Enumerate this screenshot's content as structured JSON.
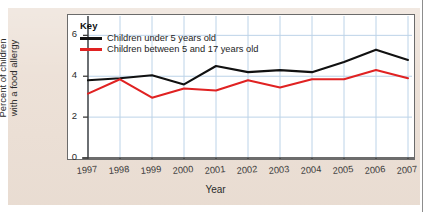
{
  "colors": {
    "page_panel": "#ece0d6",
    "plot_background": "#ffffff",
    "grid": "#bcd3e8",
    "axis": "#3b3b3b",
    "series_under5": "#111111",
    "series_5to17": "#e02222"
  },
  "legend": {
    "title": "Key",
    "position": "top-left-inside",
    "items": [
      {
        "label": "Children under 5 years old",
        "color": "#111111",
        "swatch": "line-swatch"
      },
      {
        "label": "Children between 5 and 17 years old",
        "color": "#e02222",
        "swatch": "line-swatch"
      }
    ]
  },
  "chart_data": {
    "type": "line",
    "title": "",
    "subtitle": "",
    "xlabel": "Year",
    "ylabel": "Percent of children with a food allergy",
    "ylabel_lines": [
      "Percent of children",
      "with a food allergy"
    ],
    "categories": [
      "1997",
      "1998",
      "1999",
      "2000",
      "2001",
      "2002",
      "2003",
      "2004",
      "2005",
      "2006",
      "2007"
    ],
    "x": [
      1997,
      1998,
      1999,
      2000,
      2001,
      2002,
      2003,
      2004,
      2005,
      2006,
      2007
    ],
    "xlim": [
      1997,
      2007
    ],
    "ylim": [
      0,
      6.8
    ],
    "yticks": [
      0,
      2,
      4,
      6
    ],
    "ytick_labels": [
      "0",
      "2",
      "4",
      "6"
    ],
    "grid": true,
    "grid_axis": "both",
    "legend_position": "upper-left",
    "series": [
      {
        "name": "Children under 5 years old",
        "color": "#111111",
        "values": [
          3.8,
          3.9,
          4.05,
          3.6,
          4.5,
          4.2,
          4.3,
          4.2,
          4.7,
          5.3,
          4.8
        ]
      },
      {
        "name": "Children between 5 and 17 years old",
        "color": "#e02222",
        "values": [
          3.15,
          3.85,
          2.95,
          3.4,
          3.3,
          3.8,
          3.45,
          3.85,
          3.85,
          4.3,
          3.9
        ]
      }
    ]
  }
}
